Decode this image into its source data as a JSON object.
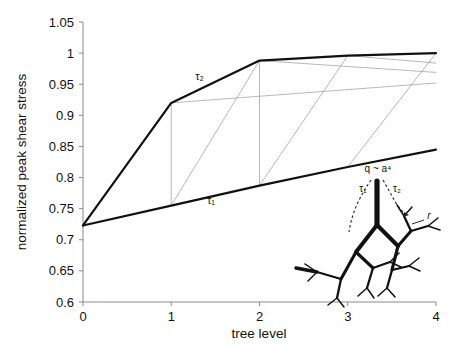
{
  "chart_data": {
    "type": "line",
    "title": "",
    "xlabel": "tree level",
    "ylabel": "normalized peak shear stress",
    "xlim": [
      0,
      4
    ],
    "ylim": [
      0.6,
      1.05
    ],
    "xticks": [
      0,
      1,
      2,
      3,
      4
    ],
    "xticklabels": [
      "0",
      "1",
      "2",
      "3",
      "4"
    ],
    "yticks": [
      0.6,
      0.65,
      0.7,
      0.75,
      0.8,
      0.85,
      0.9,
      0.95,
      1,
      1.05
    ],
    "yticklabels": [
      "0.6",
      "0.65",
      "0.7",
      "0.75",
      "0.8",
      "0.85",
      "0.9",
      "0.95",
      "1",
      "1.05"
    ],
    "grid": false,
    "legend": "none",
    "x": [
      0,
      1,
      2,
      3,
      4
    ],
    "series": [
      {
        "name": "tau_2",
        "label": "τ₂",
        "color": "#111111",
        "linewidth": 2.2,
        "values": [
          0.723,
          0.92,
          0.988,
          0.996,
          1.0
        ],
        "label_x": 1.32,
        "label_y": 0.957
      },
      {
        "name": "tau_1",
        "label": "τ₁",
        "color": "#111111",
        "linewidth": 2.2,
        "values": [
          0.723,
          0.755,
          0.787,
          0.817,
          0.845
        ],
        "label_x": 1.45,
        "label_y": 0.757
      }
    ],
    "connector_lines": {
      "name": "intermediate-level-lines",
      "color": "#9a9a9a",
      "linewidth": 0.7,
      "segments": [
        [
          [
            1,
            0.92
          ],
          [
            4,
            0.952
          ]
        ],
        [
          [
            2,
            0.988
          ],
          [
            4,
            0.969
          ]
        ],
        [
          [
            3,
            0.996
          ],
          [
            4,
            0.984
          ]
        ],
        [
          [
            1,
            0.755
          ],
          [
            2,
            0.988
          ]
        ],
        [
          [
            2,
            0.787
          ],
          [
            3,
            0.996
          ]
        ],
        [
          [
            3,
            0.817
          ],
          [
            4,
            1.0
          ]
        ],
        [
          [
            1,
            0.755
          ],
          [
            1,
            0.92
          ]
        ],
        [
          [
            2,
            0.787
          ],
          [
            2,
            0.988
          ]
        ]
      ]
    },
    "inset": {
      "name": "branching-tree-diagram",
      "flow_label": "q ~ a⁴",
      "tau1_label": "τ₁",
      "tau2_label": "τ₂",
      "radius_label": "r"
    }
  }
}
